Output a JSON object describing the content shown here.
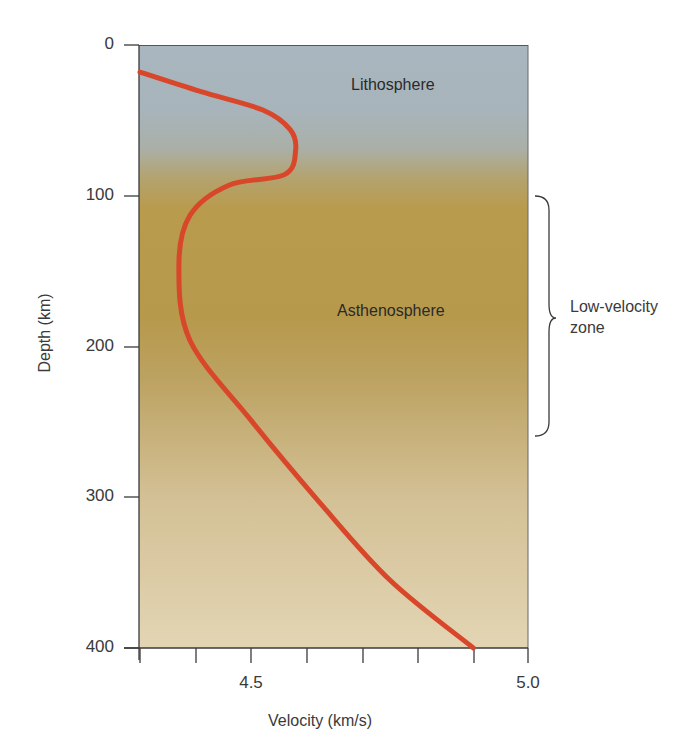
{
  "chart_data": {
    "type": "line",
    "title": "",
    "xlabel": "Velocity (km/s)",
    "ylabel": "Depth (km)",
    "xlim": [
      4.3,
      5.0
    ],
    "ylim": [
      400,
      0
    ],
    "y_inverted": true,
    "grid": false,
    "x_ticks": [
      4.3,
      4.4,
      4.5,
      4.6,
      4.7,
      4.8,
      4.9,
      5.0
    ],
    "x_tick_labels": [
      {
        "value": 4.5,
        "label": "4.5"
      },
      {
        "value": 5.0,
        "label": "5.0"
      }
    ],
    "y_ticks": [
      0,
      100,
      200,
      300,
      400
    ],
    "y_tick_labels": [
      "0",
      "100",
      "200",
      "300",
      "400"
    ],
    "series": [
      {
        "name": "Seismic velocity profile",
        "color": "#d9472b",
        "points": [
          {
            "v": 4.3,
            "d": 18
          },
          {
            "v": 4.41,
            "d": 31
          },
          {
            "v": 4.52,
            "d": 43
          },
          {
            "v": 4.57,
            "d": 56
          },
          {
            "v": 4.58,
            "d": 70
          },
          {
            "v": 4.56,
            "d": 86
          },
          {
            "v": 4.46,
            "d": 93
          },
          {
            "v": 4.39,
            "d": 113
          },
          {
            "v": 4.37,
            "d": 146
          },
          {
            "v": 4.39,
            "d": 196
          },
          {
            "v": 4.5,
            "d": 249
          },
          {
            "v": 4.62,
            "d": 302
          },
          {
            "v": 4.75,
            "d": 355
          },
          {
            "v": 4.9,
            "d": 400
          }
        ]
      }
    ],
    "regions": [
      {
        "label": "Lithosphere",
        "depth_range": [
          0,
          100
        ],
        "color": "#a7b3bb"
      },
      {
        "label": "Asthenosphere",
        "depth_range": [
          100,
          400
        ],
        "color": "#b89a4c"
      }
    ],
    "annotations": [
      {
        "type": "brace",
        "label": "Low-velocity zone",
        "depth_range": [
          100,
          260
        ]
      }
    ]
  },
  "labels": {
    "y_axis_title": "Depth (km)",
    "x_axis_title": "Velocity (km/s)",
    "y_ticks": [
      "0",
      "100",
      "200",
      "300",
      "400"
    ],
    "x_tick_45": "4.5",
    "x_tick_50": "5.0",
    "lithosphere": "Lithosphere",
    "asthenosphere": "Asthenosphere",
    "lvz_line1": "Low-velocity",
    "lvz_line2": "zone"
  },
  "colors": {
    "curve": "#d9472b",
    "sky_top": "#a9b6bf",
    "transition": "#b09a5e",
    "asthenosphere": "#b8994a",
    "bottom": "#e2d3b1",
    "axis": "#3a3a3a"
  }
}
